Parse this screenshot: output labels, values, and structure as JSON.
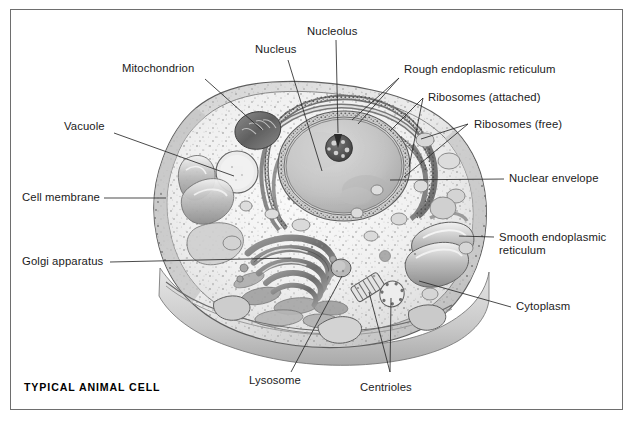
{
  "figure": {
    "caption": "TYPICAL ANIMAL CELL",
    "style": "grayscale pencil/airbrush scientific illustration",
    "frame_color": "#6e6e6e",
    "background_color": "#ffffff",
    "ink_color": "#1b1b1b"
  },
  "labels": [
    {
      "id": "mitochondrion",
      "text": "Mitochondrion"
    },
    {
      "id": "nucleus",
      "text": "Nucleus"
    },
    {
      "id": "nucleolus",
      "text": "Nucleolus"
    },
    {
      "id": "rough-er",
      "text": "Rough endoplasmic reticulum"
    },
    {
      "id": "ribosomes-attached",
      "text": "Ribosomes (attached)"
    },
    {
      "id": "ribosomes-free",
      "text": "Ribosomes (free)"
    },
    {
      "id": "nuclear-envelope",
      "text": "Nuclear envelope"
    },
    {
      "id": "smooth-er-line1",
      "text": "Smooth endoplasmic"
    },
    {
      "id": "smooth-er-line2",
      "text": "reticulum"
    },
    {
      "id": "cytoplasm",
      "text": "Cytoplasm"
    },
    {
      "id": "vacuole",
      "text": "Vacuole"
    },
    {
      "id": "cell-membrane",
      "text": "Cell membrane"
    },
    {
      "id": "golgi-apparatus",
      "text": "Golgi apparatus"
    },
    {
      "id": "lysosome",
      "text": "Lysosome"
    },
    {
      "id": "centrioles",
      "text": "Centrioles"
    }
  ],
  "organelles": [
    {
      "name": "nucleus",
      "shape": "large oval, mid-gray, upper-right-centre of cell"
    },
    {
      "name": "nucleolus",
      "shape": "small dark granular sphere inside nucleus"
    },
    {
      "name": "nuclear-envelope",
      "shape": "double membrane ring around nucleus"
    },
    {
      "name": "rough-endoplasmic-reticulum",
      "shape": "stacked concentric curved sheets, stippled with ribosomes"
    },
    {
      "name": "smooth-endoplasmic-reticulum",
      "shape": "smooth flattened tubes, right side of cell"
    },
    {
      "name": "golgi-apparatus",
      "shape": "stack of curved flattened sacs, lower-left-centre"
    },
    {
      "name": "mitochondrion",
      "shape": "dark elongated capsule with cristae, upper left"
    },
    {
      "name": "vacuole",
      "shape": "clear circular vesicle, left of nucleus"
    },
    {
      "name": "lysosome",
      "shape": "small round dense vesicle, lower centre"
    },
    {
      "name": "centrioles",
      "shape": "pair of striped cylinders at right angles, bottom centre"
    },
    {
      "name": "ribosomes-free",
      "shape": "scattered dots throughout cytoplasm"
    },
    {
      "name": "cell-membrane",
      "shape": "stippled outer boundary of cell blob"
    },
    {
      "name": "cytoplasm",
      "shape": "pale speckled ground substance filling the cell"
    }
  ]
}
